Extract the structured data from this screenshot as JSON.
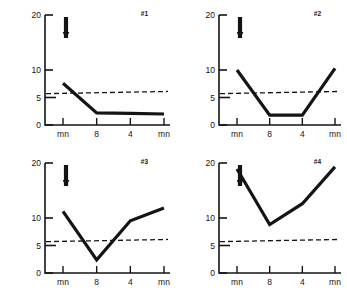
{
  "figure": {
    "ylabel_text": "μg% CORTISOL",
    "ylabel_units": "μg%",
    "ylabel_analyte": "CORTISOL",
    "background_color": "#ffffff",
    "line_color": "#141414",
    "axis_color": "#141414",
    "baseline_color": "#141414",
    "arrow_name": "stimulus-arrow"
  },
  "chart_data": [
    {
      "type": "line",
      "title": "#1",
      "panel_id": "#1",
      "xlabel": "",
      "ylabel": "μg% CORTISOL",
      "x_categories": [
        "mn",
        "8",
        "4",
        "mn"
      ],
      "x": [
        0,
        1,
        2,
        3
      ],
      "values": [
        7.6,
        2.2,
        2.1,
        2.0
      ],
      "ylim": [
        0,
        20
      ],
      "yticks": [
        0,
        5,
        10,
        20
      ],
      "ytick_labels": [
        "0",
        "5",
        "10",
        "20"
      ],
      "grid": false,
      "legend": "none",
      "annotations": [
        {
          "name": "stimulus-arrow",
          "x": 0,
          "label": "↓",
          "description": "downward arrow marking stimulus at mn"
        }
      ],
      "reference_line": {
        "name": "normal-baseline",
        "style": "dashed",
        "y_start": 5.7,
        "y_end": 6.1
      }
    },
    {
      "type": "line",
      "title": "#2",
      "panel_id": "#2",
      "xlabel": "",
      "ylabel": "μg% CORTISOL",
      "x_categories": [
        "mn",
        "8",
        "4",
        "mn"
      ],
      "x": [
        0,
        1,
        2,
        3
      ],
      "values": [
        10.0,
        1.8,
        1.8,
        10.3
      ],
      "ylim": [
        0,
        20
      ],
      "yticks": [
        0,
        5,
        10,
        20
      ],
      "ytick_labels": [
        "0",
        "5",
        "10",
        "20"
      ],
      "grid": false,
      "legend": "none",
      "annotations": [
        {
          "name": "stimulus-arrow",
          "x": 0,
          "label": "↓",
          "description": "downward arrow marking stimulus at mn"
        }
      ],
      "reference_line": {
        "name": "normal-baseline",
        "style": "dashed",
        "y_start": 5.7,
        "y_end": 6.1
      }
    },
    {
      "type": "line",
      "title": "#3",
      "panel_id": "#3",
      "xlabel": "",
      "ylabel": "μg% CORTISOL",
      "x_categories": [
        "mn",
        "8",
        "4",
        "mn"
      ],
      "x": [
        0,
        1,
        2,
        3
      ],
      "values": [
        11.2,
        2.4,
        9.5,
        11.8
      ],
      "ylim": [
        0,
        20
      ],
      "yticks": [
        0,
        5,
        10,
        20
      ],
      "ytick_labels": [
        "0",
        "5",
        "10",
        "20"
      ],
      "grid": false,
      "legend": "none",
      "annotations": [
        {
          "name": "stimulus-arrow",
          "x": 0,
          "label": "↓",
          "description": "downward arrow marking stimulus at mn"
        }
      ],
      "reference_line": {
        "name": "normal-baseline",
        "style": "dashed",
        "y_start": 5.7,
        "y_end": 6.1
      }
    },
    {
      "type": "line",
      "title": "#4",
      "panel_id": "#4",
      "xlabel": "",
      "ylabel": "μg% CORTISOL",
      "x_categories": [
        "mn",
        "8",
        "4",
        "mn"
      ],
      "x": [
        0,
        1,
        2,
        3
      ],
      "values": [
        18.9,
        8.8,
        12.6,
        19.3
      ],
      "ylim": [
        0,
        20
      ],
      "yticks": [
        0,
        5,
        10,
        20
      ],
      "ytick_labels": [
        "0",
        "5",
        "10",
        "20"
      ],
      "grid": false,
      "legend": "none",
      "annotations": [
        {
          "name": "stimulus-arrow",
          "x": 0,
          "label": "↓",
          "description": "downward arrow marking stimulus at mn"
        }
      ],
      "reference_line": {
        "name": "normal-baseline",
        "style": "dashed",
        "y_start": 5.7,
        "y_end": 6.1
      }
    }
  ]
}
